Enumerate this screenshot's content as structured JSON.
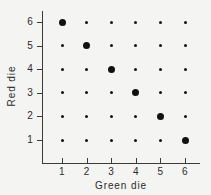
{
  "chart_data": {
    "type": "scatter",
    "title": "",
    "xlabel": "Green die",
    "ylabel": "Red die",
    "xlim": [
      0.5,
      6.7
    ],
    "ylim": [
      0.5,
      6.6
    ],
    "grid": false,
    "legend": null,
    "x_ticks": [
      "1",
      "2",
      "3",
      "4",
      "5",
      "6"
    ],
    "y_ticks": [
      "1",
      "2",
      "3",
      "4",
      "5",
      "6"
    ],
    "x_tick_values": [
      1,
      2,
      3,
      4,
      5,
      6
    ],
    "y_tick_values": [
      1,
      2,
      3,
      4,
      5,
      6
    ],
    "series": [
      {
        "name": "sample space",
        "marker": "small-dot",
        "color": "#111111",
        "points": [
          {
            "x": 1,
            "y": 1
          },
          {
            "x": 2,
            "y": 1
          },
          {
            "x": 3,
            "y": 1
          },
          {
            "x": 4,
            "y": 1
          },
          {
            "x": 5,
            "y": 1
          },
          {
            "x": 1,
            "y": 2
          },
          {
            "x": 2,
            "y": 2
          },
          {
            "x": 3,
            "y": 2
          },
          {
            "x": 4,
            "y": 2
          },
          {
            "x": 6,
            "y": 2
          },
          {
            "x": 1,
            "y": 3
          },
          {
            "x": 2,
            "y": 3
          },
          {
            "x": 3,
            "y": 3
          },
          {
            "x": 5,
            "y": 3
          },
          {
            "x": 6,
            "y": 3
          },
          {
            "x": 1,
            "y": 4
          },
          {
            "x": 2,
            "y": 4
          },
          {
            "x": 4,
            "y": 4
          },
          {
            "x": 5,
            "y": 4
          },
          {
            "x": 6,
            "y": 4
          },
          {
            "x": 1,
            "y": 5
          },
          {
            "x": 3,
            "y": 5
          },
          {
            "x": 4,
            "y": 5
          },
          {
            "x": 5,
            "y": 5
          },
          {
            "x": 6,
            "y": 5
          },
          {
            "x": 2,
            "y": 6
          },
          {
            "x": 3,
            "y": 6
          },
          {
            "x": 4,
            "y": 6
          },
          {
            "x": 5,
            "y": 6
          },
          {
            "x": 6,
            "y": 6
          }
        ]
      },
      {
        "name": "sum equals seven",
        "marker": "large-dot",
        "color": "#111111",
        "points": [
          {
            "x": 6,
            "y": 1
          },
          {
            "x": 5,
            "y": 2
          },
          {
            "x": 4,
            "y": 3
          },
          {
            "x": 3,
            "y": 4
          },
          {
            "x": 2,
            "y": 5
          },
          {
            "x": 1,
            "y": 6
          }
        ]
      }
    ]
  },
  "colors": {
    "background": "#f4f4f2",
    "axis": "#3b3b3b",
    "marker": "#111111",
    "text": "#2b2b2b"
  }
}
